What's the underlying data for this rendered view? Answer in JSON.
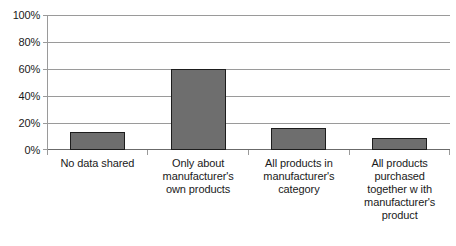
{
  "chart_data": {
    "type": "bar",
    "title": "",
    "xlabel": "",
    "ylabel": "",
    "categories": [
      "No data shared",
      "Only about\nmanufacturer's\nown products",
      "All products in\nmanufacturer's\ncategory",
      "All products\npurchased\ntogether w ith\nmanufacturer's\nproduct"
    ],
    "values": [
      13,
      60,
      16,
      9
    ],
    "value_labels": [
      "13%",
      "60%",
      "16%",
      "9%"
    ],
    "ylim": [
      0,
      100
    ],
    "ytick_labels": [
      "100%",
      "80%",
      "60%",
      "40%",
      "20%",
      "0%"
    ],
    "ytick_values": [
      100,
      80,
      60,
      40,
      20,
      0
    ],
    "grid": true,
    "legend": "none",
    "bar_color": "#6e6e6e",
    "bar_border_color": "#1d1d1d",
    "gridline_color": "#9a9a9a",
    "background": "#ffffff"
  }
}
